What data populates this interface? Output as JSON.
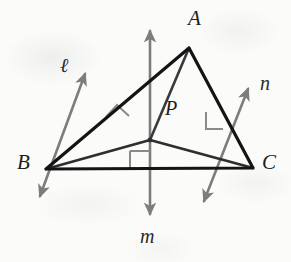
{
  "figure": {
    "kind": "geometry-diagram",
    "background_color": "#fbfbfa",
    "triangle_color": "#1a1a1a",
    "bisector_color": "#7d7d7d",
    "cevian_color": "#3a3a3a",
    "right_angle_color": "#8a8a8a",
    "label_color": "#1d1d1d",
    "labels": {
      "vertex_a": "A",
      "vertex_b": "B",
      "vertex_c": "C",
      "center_p": "P",
      "line_l": "ℓ",
      "line_m": "m",
      "line_n": "n"
    },
    "points": {
      "A": {
        "x": 189,
        "y": 48
      },
      "B": {
        "x": 46,
        "y": 169
      },
      "C": {
        "x": 253,
        "y": 168
      },
      "P": {
        "x": 150,
        "y": 140
      }
    },
    "label_positions": {
      "A": {
        "x": 188,
        "y": 8
      },
      "B": {
        "x": 17,
        "y": 152
      },
      "C": {
        "x": 262,
        "y": 152
      },
      "P": {
        "x": 165,
        "y": 98
      },
      "l": {
        "x": 60,
        "y": 55
      },
      "m": {
        "x": 140,
        "y": 226
      },
      "n": {
        "x": 260,
        "y": 73
      }
    },
    "lines": [
      {
        "name": "l",
        "role": "perpendicular-bisector-of-AB",
        "from": {
          "x": 85,
          "y": 74
        },
        "to": {
          "x": 40,
          "y": 196
        }
      },
      {
        "name": "m",
        "role": "perpendicular-bisector-of-BC",
        "from": {
          "x": 150,
          "y": 31
        },
        "to": {
          "x": 150,
          "y": 214
        }
      },
      {
        "name": "n",
        "role": "perpendicular-bisector-of-AC",
        "from": {
          "x": 248,
          "y": 89
        },
        "to": {
          "x": 204,
          "y": 201
        }
      }
    ],
    "segments": [
      {
        "name": "PA",
        "from": "P",
        "to": "A"
      },
      {
        "name": "PB",
        "from": "P",
        "to": "B"
      },
      {
        "name": "PC",
        "from": "P",
        "to": "C"
      }
    ],
    "right_angles": [
      {
        "name": "right-angle-on-AB",
        "at": {
          "x": 117,
          "y": 108
        }
      },
      {
        "name": "right-angle-on-AC",
        "at": {
          "x": 221,
          "y": 110
        }
      },
      {
        "name": "right-angle-on-BC",
        "at": {
          "x": 150,
          "y": 169
        }
      }
    ]
  }
}
